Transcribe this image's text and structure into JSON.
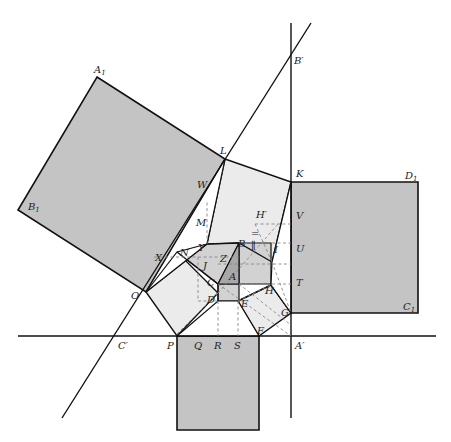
{
  "figure": {
    "type": "geometric-construction",
    "colors": {
      "background": "#ffffff",
      "stroke": "#111111",
      "dashed": "#888888",
      "large_square_fill": "#c4c4c4",
      "light_fill": "#e8e8e8",
      "medium_fill": "#d2d2d2",
      "dark_fill": "#a8a8a8"
    }
  },
  "labels": {
    "A1": "A",
    "A1_sub": "1",
    "B1": "B",
    "B1_sub": "1",
    "C1": "C",
    "C1_sub": "1",
    "D1": "D",
    "D1_sub": "1",
    "Bp": "B′",
    "Cp": "C′",
    "Ap": "A′",
    "Hp": "H′",
    "L": "L",
    "K": "K",
    "W": "W",
    "M": "M",
    "V": "V",
    "U": "U",
    "T": "T",
    "X": "X",
    "N": "N",
    "Y": "Y",
    "Z": "Z",
    "J": "J",
    "B": "B",
    "I": "I",
    "A": "A",
    "C": "C",
    "D": "D",
    "E": "E",
    "H": "H",
    "G": "G",
    "F": "F",
    "O": "O",
    "P": "P",
    "Q": "Q",
    "R": "R",
    "S": "S"
  },
  "marks": {
    "double_tick": "=",
    "parallel_tick": "∥"
  }
}
